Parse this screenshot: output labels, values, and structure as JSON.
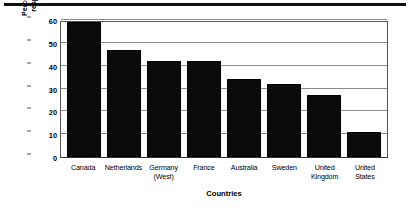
{
  "chart_data": {
    "type": "bar",
    "title": "",
    "subtitle": "",
    "xlabel": "Countries",
    "ylabel_line1": "Percentage of population",
    "ylabel_line2": "responding favourably",
    "ylabel": "Percentage of population responding favourably",
    "categories": [
      "Canada",
      "Netherlands",
      "Germany (West)",
      "France",
      "Australia",
      "Sweden",
      "United Kingdom",
      "United States"
    ],
    "category_lines": [
      [
        "Canada"
      ],
      [
        "Netherlands"
      ],
      [
        "Germany",
        "(West)"
      ],
      [
        "France"
      ],
      [
        "Australia"
      ],
      [
        "Sweden"
      ],
      [
        "United",
        "Kingdom"
      ],
      [
        "United States"
      ]
    ],
    "values": [
      59,
      47,
      42,
      42,
      34,
      32,
      27,
      11
    ],
    "ylim": [
      0,
      60
    ],
    "yticks": [
      0,
      10,
      20,
      30,
      40,
      50,
      60
    ],
    "ytick_labels": [
      "0",
      "10",
      "20",
      "30",
      "40",
      "50",
      "60"
    ],
    "grid": true,
    "grid_axis": "y",
    "legend": false,
    "legend_position": "none",
    "bar_color": "#0b0b0b",
    "grid_color": "#8a8a8a",
    "frame_color": "#555555",
    "background_color": "#ffffff"
  }
}
